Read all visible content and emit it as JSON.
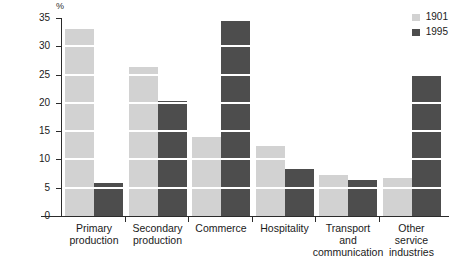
{
  "chart_data": {
    "type": "bar",
    "title": "",
    "xlabel": "",
    "ylabel": "%",
    "ylim": [
      0,
      35
    ],
    "yticks": [
      0,
      5,
      10,
      15,
      20,
      25,
      30,
      35
    ],
    "grid": "horizontal-white-stripes-every-5-percent",
    "legend_position": "top-right",
    "categories": [
      "Primary production",
      "Secondary production",
      "Commerce",
      "Hospitality",
      "Transport and communication",
      "Other service industries"
    ],
    "series": [
      {
        "name": "1901",
        "color": "#d2d2d2",
        "values": [
          33.0,
          26.3,
          13.9,
          12.3,
          7.3,
          6.7
        ]
      },
      {
        "name": "1995",
        "color": "#4d4d4d",
        "values": [
          5.8,
          20.4,
          34.5,
          8.3,
          6.4,
          24.8
        ]
      }
    ]
  },
  "axis": {
    "unit_label": "%",
    "tick_labels": [
      "0",
      "5",
      "10",
      "15",
      "20",
      "25",
      "30",
      "35"
    ]
  },
  "legend": {
    "items": [
      {
        "label": "1901",
        "color": "#d2d2d2"
      },
      {
        "label": "1995",
        "color": "#4d4d4d"
      }
    ]
  },
  "category_labels": [
    {
      "lines": [
        "Primary",
        "production"
      ]
    },
    {
      "lines": [
        "Secondary",
        "production"
      ]
    },
    {
      "lines": [
        "Commerce"
      ]
    },
    {
      "lines": [
        "Hospitality"
      ]
    },
    {
      "lines": [
        "Transport",
        "and",
        "communication"
      ]
    },
    {
      "lines": [
        "Other",
        "service",
        "industries"
      ]
    }
  ]
}
